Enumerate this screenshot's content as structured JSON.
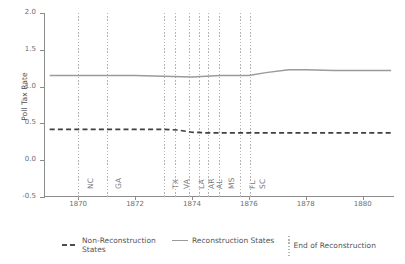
{
  "chart_data": {
    "type": "line",
    "title": "",
    "xlabel": "",
    "ylabel": "Poll Tax Rate",
    "xlim": [
      1868.8,
      1881.1
    ],
    "ylim": [
      -0.5,
      2.0
    ],
    "grid": false,
    "legend_position": "bottom",
    "y_ticks": [
      {
        "value": 2.0,
        "label": "2.0"
      },
      {
        "value": 1.5,
        "label": "1.5"
      },
      {
        "value": 1.0,
        "label": "1.0"
      },
      {
        "value": 0.5,
        "label": "0.5"
      },
      {
        "value": 0.0,
        "label": "0.0"
      },
      {
        "value": -0.5,
        "label": "-0.5"
      }
    ],
    "x_ticks": [
      {
        "value": 1870,
        "label": "1870"
      },
      {
        "value": 1872,
        "label": "1872"
      },
      {
        "value": 1874,
        "label": "1874"
      },
      {
        "value": 1876,
        "label": "1876"
      },
      {
        "value": 1878,
        "label": "1878"
      },
      {
        "value": 1880,
        "label": "1880"
      }
    ],
    "series": [
      {
        "name": "Reconstruction States",
        "style": "solid",
        "color": "#9a9a9a",
        "x": [
          1869.0,
          1870.0,
          1871.0,
          1872.0,
          1873.0,
          1874.0,
          1875.0,
          1876.0,
          1876.6,
          1877.4,
          1878.0,
          1879.0,
          1880.0,
          1881.0
        ],
        "values": [
          1.15,
          1.15,
          1.15,
          1.15,
          1.14,
          1.13,
          1.15,
          1.15,
          1.19,
          1.23,
          1.23,
          1.22,
          1.22,
          1.22
        ]
      },
      {
        "name": "Non-Reconstruction States",
        "style": "dashed",
        "color": "#3f3f3f",
        "x": [
          1869.0,
          1870.0,
          1871.0,
          1872.0,
          1873.0,
          1873.5,
          1874.0,
          1874.6,
          1875.0,
          1876.0,
          1877.0,
          1878.0,
          1879.0,
          1880.0,
          1881.0
        ],
        "values": [
          0.42,
          0.42,
          0.42,
          0.42,
          0.42,
          0.41,
          0.38,
          0.37,
          0.37,
          0.37,
          0.37,
          0.37,
          0.37,
          0.37,
          0.37
        ]
      }
    ],
    "event_lines": {
      "label": "End of Reconstruction",
      "style": "dotted",
      "color": "#b4b4b4",
      "events": [
        {
          "state": "NC",
          "year": 1870.0
        },
        {
          "state": "GA",
          "year": 1871.0
        },
        {
          "state": "TX",
          "year": 1873.0
        },
        {
          "state": "VA",
          "year": 1873.4
        },
        {
          "state": "LA",
          "year": 1873.9
        },
        {
          "state": "AR",
          "year": 1874.25
        },
        {
          "state": "AL",
          "year": 1874.55
        },
        {
          "state": "MS",
          "year": 1874.95
        },
        {
          "state": "FL",
          "year": 1875.7
        },
        {
          "state": "SC",
          "year": 1876.05
        }
      ]
    }
  },
  "legend": {
    "items": [
      {
        "label": "Non-Reconstruction States",
        "swatch": "dash"
      },
      {
        "label": "Reconstruction States",
        "swatch": "solid"
      },
      {
        "label": "End of Reconstruction",
        "swatch": "dot"
      }
    ]
  }
}
